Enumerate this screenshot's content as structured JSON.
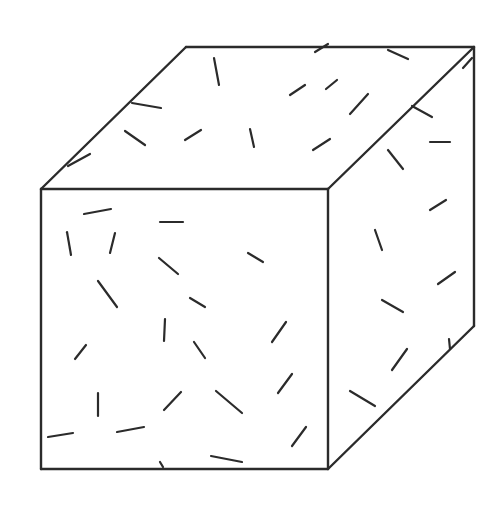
{
  "figure": {
    "width": 501,
    "height": 507,
    "stroke_color": "#2b2b2b",
    "background": "#ffffff"
  },
  "cube": {
    "vertices": {
      "front_top_left": [
        41,
        189
      ],
      "front_top_right": [
        328,
        189
      ],
      "front_bottom_left": [
        41,
        469
      ],
      "front_bottom_right": [
        328,
        469
      ],
      "back_top_left": [
        186,
        47
      ],
      "back_top_right": [
        474,
        47
      ],
      "back_bottom_right": [
        474,
        326
      ]
    },
    "faces": {
      "front": [
        [
          41,
          189
        ],
        [
          328,
          189
        ],
        [
          328,
          469
        ],
        [
          41,
          469
        ]
      ],
      "top": [
        [
          41,
          189
        ],
        [
          186,
          47
        ],
        [
          474,
          47
        ],
        [
          328,
          189
        ]
      ],
      "right": [
        [
          328,
          189
        ],
        [
          474,
          47
        ],
        [
          474,
          326
        ],
        [
          328,
          469
        ]
      ]
    }
  },
  "dashes": {
    "top": [
      [
        214,
        58,
        219,
        85
      ],
      [
        132,
        103,
        161,
        108
      ],
      [
        125,
        131,
        145,
        145
      ],
      [
        185,
        140,
        201,
        130
      ],
      [
        68,
        166,
        90,
        154
      ],
      [
        250,
        129,
        254,
        147
      ],
      [
        290,
        95,
        305,
        85
      ],
      [
        313,
        150,
        330,
        139
      ],
      [
        326,
        89,
        337,
        80
      ],
      [
        350,
        114,
        368,
        94
      ],
      [
        315,
        52,
        328,
        44
      ],
      [
        388,
        50,
        408,
        59
      ],
      [
        463,
        68,
        472,
        58
      ]
    ],
    "front": [
      [
        84,
        214,
        111,
        209
      ],
      [
        160,
        222,
        183,
        222
      ],
      [
        67,
        232,
        71,
        255
      ],
      [
        110,
        253,
        115,
        233
      ],
      [
        159,
        258,
        178,
        274
      ],
      [
        248,
        253,
        263,
        262
      ],
      [
        98,
        281,
        117,
        307
      ],
      [
        190,
        298,
        205,
        307
      ],
      [
        164,
        341,
        165,
        319
      ],
      [
        75,
        359,
        86,
        345
      ],
      [
        194,
        342,
        205,
        358
      ],
      [
        98,
        393,
        98,
        416
      ],
      [
        164,
        410,
        181,
        392
      ],
      [
        216,
        391,
        242,
        413
      ],
      [
        48,
        437,
        73,
        433
      ],
      [
        117,
        432,
        144,
        427
      ],
      [
        160,
        462,
        163,
        467
      ],
      [
        211,
        456,
        242,
        462
      ],
      [
        272,
        342,
        286,
        322
      ],
      [
        278,
        393,
        292,
        374
      ],
      [
        292,
        446,
        306,
        427
      ]
    ],
    "right": [
      [
        388,
        150,
        403,
        169
      ],
      [
        430,
        142,
        450,
        142
      ],
      [
        412,
        106,
        432,
        117
      ],
      [
        430,
        210,
        446,
        200
      ],
      [
        375,
        230,
        382,
        250
      ],
      [
        438,
        284,
        455,
        272
      ],
      [
        382,
        300,
        403,
        312
      ],
      [
        392,
        370,
        407,
        349
      ],
      [
        350,
        391,
        375,
        406
      ],
      [
        449,
        339,
        450,
        349
      ]
    ]
  }
}
